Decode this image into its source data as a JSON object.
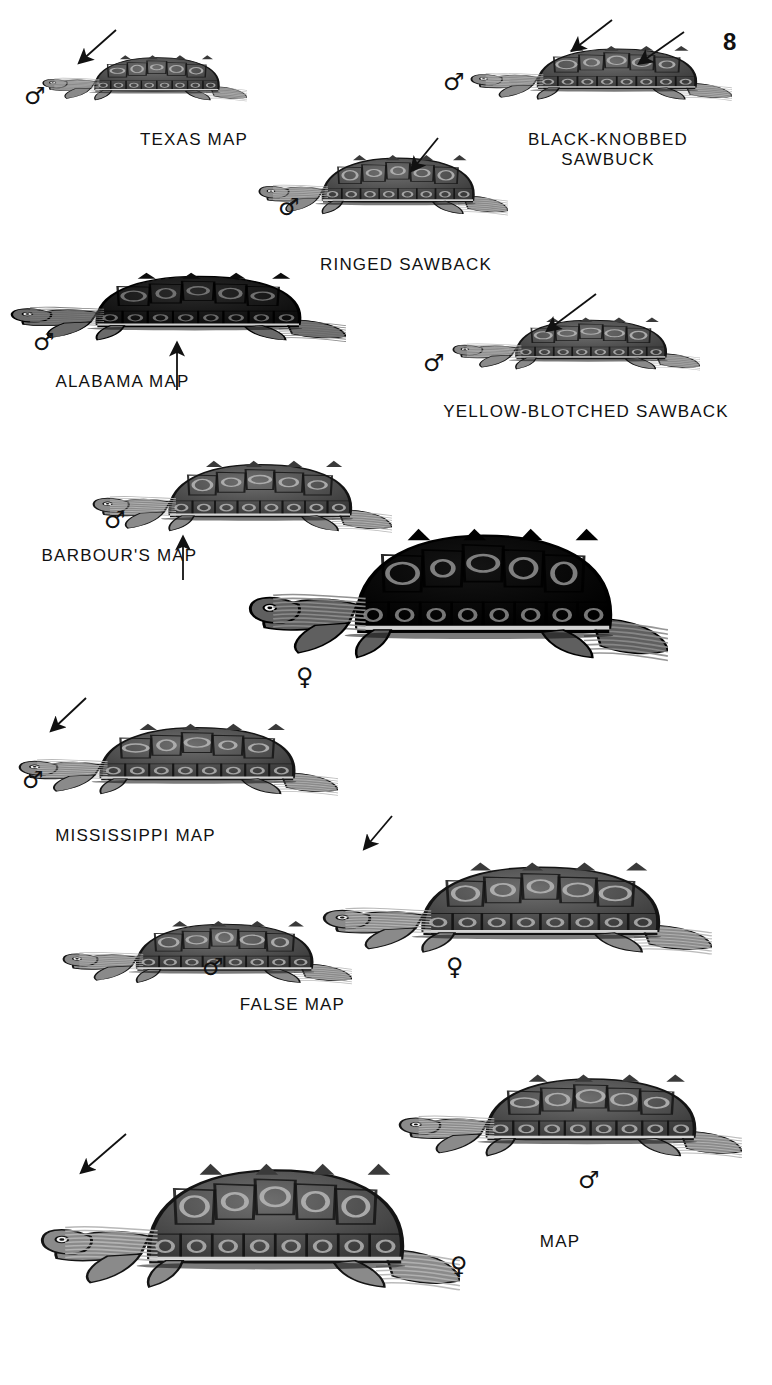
{
  "plate": {
    "page_number": "8",
    "background_color": "#ffffff",
    "ink_color": "#111111",
    "width": 772,
    "height": 1385
  },
  "symbols": {
    "male": "♂",
    "female": "♀"
  },
  "figures": [
    {
      "id": "texas-map",
      "caption": "TEXAS MAP",
      "caption_x": 108,
      "caption_y": 130,
      "caption_w": 172,
      "sex": "male",
      "sex_x": 24,
      "sex_y": 84,
      "fig_x": 42,
      "fig_y": 40,
      "fig_w": 205,
      "fig_h": 80,
      "tone": "mid",
      "arrow": {
        "x1": 116,
        "y1": 30,
        "x2": 80,
        "y2": 62
      }
    },
    {
      "id": "black-knobbed-sawback",
      "caption": "BLACK-KNOBBED\nSAWBUCK",
      "caption_x": 498,
      "caption_y": 130,
      "caption_w": 220,
      "sex": "male",
      "sex_x": 443,
      "sex_y": 70,
      "fig_x": 470,
      "fig_y": 28,
      "fig_w": 262,
      "fig_h": 95,
      "tone": "mid",
      "arrow": {
        "x1": 612,
        "y1": 20,
        "x2": 573,
        "y2": 50
      },
      "arrow2": {
        "x1": 684,
        "y1": 32,
        "x2": 640,
        "y2": 63
      }
    },
    {
      "id": "ringed-sawback",
      "caption": "RINGED SAWBACK",
      "caption_x": 300,
      "caption_y": 255,
      "caption_w": 212,
      "sex": "male",
      "sex_x": 278,
      "sex_y": 195,
      "fig_x": 258,
      "fig_y": 135,
      "fig_w": 250,
      "fig_h": 105,
      "tone": "mid",
      "arrow": {
        "x1": 438,
        "y1": 138,
        "x2": 412,
        "y2": 170
      }
    },
    {
      "id": "alabama-map",
      "caption": "ALABAMA MAP",
      "caption_x": 40,
      "caption_y": 372,
      "caption_w": 165,
      "sex": "male",
      "sex_x": 33,
      "sex_y": 330,
      "fig_x": 10,
      "fig_y": 250,
      "fig_w": 336,
      "fig_h": 120,
      "tone": "dark",
      "pointer": {
        "x": 177,
        "y": 344,
        "len": 46
      }
    },
    {
      "id": "yellow-blotched-sawback",
      "caption": "YELLOW-BLOTCHED SAWBACK",
      "caption_x": 425,
      "caption_y": 402,
      "caption_w": 322,
      "sex": "male",
      "sex_x": 423,
      "sex_y": 351,
      "fig_x": 452,
      "fig_y": 300,
      "fig_w": 248,
      "fig_h": 92,
      "tone": "mid",
      "arrow": {
        "x1": 596,
        "y1": 294,
        "x2": 548,
        "y2": 330
      }
    },
    {
      "id": "barbours-map-male",
      "caption": "BARBOUR'S MAP",
      "caption_x": 32,
      "caption_y": 546,
      "caption_w": 175,
      "sex": "male",
      "sex_x": 104,
      "sex_y": 508,
      "fig_x": 92,
      "fig_y": 437,
      "fig_w": 300,
      "fig_h": 125,
      "tone": "mid",
      "pointer": {
        "x": 183,
        "y": 538,
        "len": 42
      }
    },
    {
      "id": "barbours-map-female",
      "caption": "",
      "sex": "female",
      "sex_x": 296,
      "sex_y": 665,
      "fig_x": 248,
      "fig_y": 485,
      "fig_w": 420,
      "fig_h": 230,
      "tone": "verydark"
    },
    {
      "id": "mississippi-map",
      "caption": "MISSISSIPPI MAP",
      "caption_x": 38,
      "caption_y": 826,
      "caption_w": 195,
      "sex": "male",
      "sex_x": 22,
      "sex_y": 768,
      "fig_x": 18,
      "fig_y": 700,
      "fig_w": 320,
      "fig_h": 125,
      "tone": "mid",
      "arrow": {
        "x1": 86,
        "y1": 698,
        "x2": 52,
        "y2": 730
      }
    },
    {
      "id": "false-map-female",
      "caption": "",
      "sex": "female",
      "sex_x": 446,
      "sex_y": 955,
      "fig_x": 322,
      "fig_y": 832,
      "fig_w": 390,
      "fig_h": 160,
      "tone": "mid",
      "arrow": {
        "x1": 392,
        "y1": 816,
        "x2": 365,
        "y2": 848
      }
    },
    {
      "id": "false-map-male",
      "caption": "FALSE MAP",
      "caption_x": 225,
      "caption_y": 995,
      "caption_w": 135,
      "sex": "male",
      "sex_x": 202,
      "sex_y": 955,
      "fig_x": 62,
      "fig_y": 900,
      "fig_w": 290,
      "fig_h": 110,
      "tone": "mid"
    },
    {
      "id": "map-male",
      "caption": "MAP",
      "caption_x": 520,
      "caption_y": 1232,
      "caption_w": 80,
      "sex": "male",
      "sex_x": 578,
      "sex_y": 1168,
      "fig_x": 398,
      "fig_y": 1047,
      "fig_w": 344,
      "fig_h": 145,
      "tone": "mid"
    },
    {
      "id": "map-female",
      "caption": "",
      "sex": "female",
      "sex_x": 450,
      "sex_y": 1254,
      "fig_x": 40,
      "fig_y": 1122,
      "fig_w": 420,
      "fig_h": 220,
      "tone": "mid",
      "arrow": {
        "x1": 126,
        "y1": 1134,
        "x2": 82,
        "y2": 1172
      }
    }
  ]
}
